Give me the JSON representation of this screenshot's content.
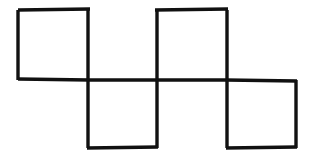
{
  "figure": {
    "background_color": "#ffffff",
    "stroke_color": "#111111",
    "stroke_width": 3.4,
    "canvas": {
      "width": 311,
      "height": 160
    },
    "cell_size": 70,
    "square_count": 4,
    "stick_count": 14
  },
  "geometry": {
    "grid_x": [
      18,
      88,
      157,
      227,
      296
    ],
    "grid_y": [
      10,
      80,
      148
    ],
    "row_top_y": 10,
    "row_mid_y": 80,
    "row_bottom_y": 148
  },
  "squares": [
    {
      "name": "top-left-square",
      "x": 18,
      "y": 10,
      "w": 70,
      "h": 70
    },
    {
      "name": "top-right-square",
      "x": 157,
      "y": 10,
      "w": 70,
      "h": 70
    },
    {
      "name": "bottom-left-square",
      "x": 88,
      "y": 80,
      "w": 69,
      "h": 68
    },
    {
      "name": "bottom-right-square",
      "x": 227,
      "y": 80,
      "w": 69,
      "h": 68
    }
  ],
  "sticks": {
    "horizontal": [
      {
        "name": "stick-top-1",
        "x1": 18,
        "y1": 10,
        "x2": 90,
        "y2": 9
      },
      {
        "name": "stick-top-2",
        "x1": 155,
        "y1": 10,
        "x2": 228,
        "y2": 9
      },
      {
        "name": "stick-mid-1",
        "x1": 18,
        "y1": 79,
        "x2": 89,
        "y2": 80
      },
      {
        "name": "stick-mid-2",
        "x1": 88,
        "y1": 80,
        "x2": 158,
        "y2": 80
      },
      {
        "name": "stick-mid-3",
        "x1": 157,
        "y1": 80,
        "x2": 228,
        "y2": 80
      },
      {
        "name": "stick-mid-4",
        "x1": 226,
        "y1": 80,
        "x2": 297,
        "y2": 81
      },
      {
        "name": "stick-bot-1",
        "x1": 87,
        "y1": 148,
        "x2": 158,
        "y2": 147
      },
      {
        "name": "stick-bot-2",
        "x1": 226,
        "y1": 148,
        "x2": 297,
        "y2": 147
      }
    ],
    "vertical": [
      {
        "name": "stick-vert-far-left",
        "x1": 18,
        "y1": 10,
        "x2": 18,
        "y2": 80
      },
      {
        "name": "stick-vert-b-top",
        "x1": 88,
        "y1": 10,
        "x2": 88,
        "y2": 80
      },
      {
        "name": "stick-vert-b-bottom",
        "x1": 88,
        "y1": 80,
        "x2": 88,
        "y2": 148
      },
      {
        "name": "stick-vert-c-top",
        "x1": 157,
        "y1": 10,
        "x2": 157,
        "y2": 80
      },
      {
        "name": "stick-vert-c-bottom",
        "x1": 157,
        "y1": 80,
        "x2": 157,
        "y2": 148
      },
      {
        "name": "stick-vert-d-top",
        "x1": 227,
        "y1": 10,
        "x2": 227,
        "y2": 80
      },
      {
        "name": "stick-vert-d-bottom",
        "x1": 227,
        "y1": 80,
        "x2": 227,
        "y2": 148
      },
      {
        "name": "stick-vert-far-right",
        "x1": 296,
        "y1": 80,
        "x2": 296,
        "y2": 148
      }
    ]
  }
}
